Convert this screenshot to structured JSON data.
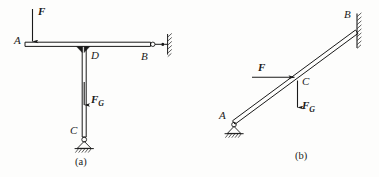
{
  "figure": {
    "background_color": "#fdfdfc",
    "line_color": "#1a1a1a",
    "panels": [
      {
        "id": "a",
        "caption": "(a)",
        "description": "T-shaped frame: horizontal beam A-D-B supported by vertical column D-C",
        "points": [
          {
            "label": "A",
            "role": "beam-left-end"
          },
          {
            "label": "D",
            "role": "beam-column-joint"
          },
          {
            "label": "B",
            "role": "beam-right-end-link-support"
          },
          {
            "label": "C",
            "role": "column-base-pin-support"
          }
        ],
        "forces": [
          {
            "label": "F",
            "subscript": "",
            "direction": "down",
            "applied_at": "A"
          },
          {
            "label": "F",
            "subscript": "G",
            "direction": "down",
            "applied_at": "column-midspan"
          }
        ],
        "supports": [
          {
            "type": "link-to-wall",
            "at": "B"
          },
          {
            "type": "pin-on-ground",
            "at": "C"
          }
        ]
      },
      {
        "id": "b",
        "caption": "(b)",
        "description": "Inclined member A-C-B, pinned at A on ground, fixed to vertical wall at B",
        "points": [
          {
            "label": "A",
            "role": "lower-pin-support"
          },
          {
            "label": "C",
            "role": "load-application-point"
          },
          {
            "label": "B",
            "role": "upper-end-at-wall"
          }
        ],
        "forces": [
          {
            "label": "F",
            "subscript": "",
            "direction": "right",
            "applied_at": "C"
          },
          {
            "label": "F",
            "subscript": "G",
            "direction": "down",
            "applied_at": "C"
          }
        ],
        "supports": [
          {
            "type": "pin-on-ground",
            "at": "A"
          },
          {
            "type": "hatched-wall",
            "at": "B"
          }
        ]
      }
    ]
  },
  "labels": {
    "a": {
      "A": "A",
      "B": "B",
      "C": "C",
      "D": "D",
      "F": "F",
      "FG_main": "F",
      "FG_sub": "G",
      "caption": "(a)"
    },
    "b": {
      "A": "A",
      "B": "B",
      "C": "C",
      "F": "F",
      "FG_main": "F",
      "FG_sub": "G",
      "caption": "(b)"
    }
  }
}
